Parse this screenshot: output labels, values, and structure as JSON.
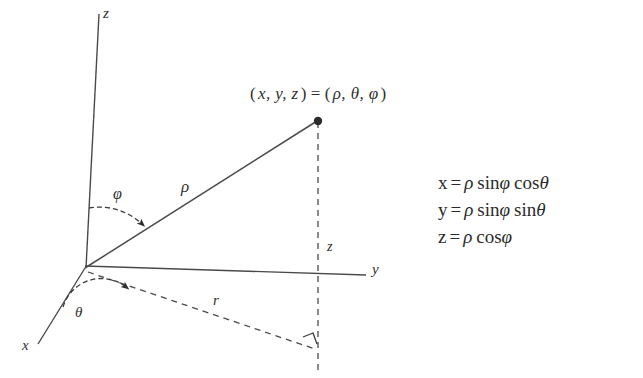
{
  "figure": {
    "type": "spherical-coordinates-diagram",
    "background_color": "#ffffff",
    "ink_color": "#2f2f2f"
  },
  "axes": {
    "z_label": "z",
    "y_label": "y",
    "x_label": "x"
  },
  "point": {
    "cartesian_open": "(",
    "cartesian": "x, y, z",
    "cartesian_close": ")",
    "equals": "=",
    "spherical_open": "(",
    "spherical": "ρ, θ, φ",
    "spherical_close": ")",
    "full_label": "(x, y, z) = (ρ, θ, φ)"
  },
  "annotations": {
    "rho": "ρ",
    "phi": "φ",
    "theta": "θ",
    "r": "r",
    "z_projection": "z"
  },
  "equations": [
    {
      "var": "x",
      "op": "=",
      "rho": "ρ",
      "fn1": "sin",
      "arg1": "φ",
      "fn2": "cos",
      "arg2": "θ",
      "full": "x = ρ sinφ cosθ"
    },
    {
      "var": "y",
      "op": "=",
      "rho": "ρ",
      "fn1": "sin",
      "arg1": "φ",
      "fn2": "sin",
      "arg2": "θ",
      "full": "y = ρ sinφ sinθ"
    },
    {
      "var": "z",
      "op": "=",
      "rho": "ρ",
      "fn1": "cos",
      "arg1": "φ",
      "fn2": "",
      "arg2": "",
      "full": "z = ρ cosφ"
    }
  ]
}
